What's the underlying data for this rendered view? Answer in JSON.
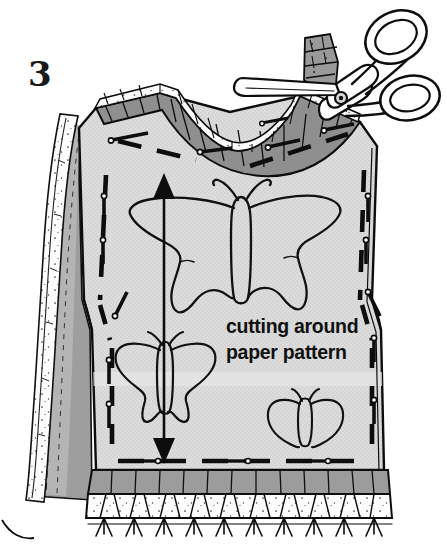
{
  "illustration": {
    "title": "Cutting around paper pattern",
    "domain_kind": "sewing-instruction-line-drawing",
    "step_number": "3",
    "caption_line_1": "cutting around",
    "caption_line_2": "paper pattern",
    "subject": "vest-garment-front-with-pinned-paper-pattern",
    "tools": [
      "scissors"
    ],
    "motifs": [
      "butterfly-large",
      "butterfly-medium",
      "butterfly-small"
    ],
    "markings": [
      "grainline-double-arrow",
      "dashed-cutting-line",
      "straight-pins"
    ]
  },
  "colors": {
    "background": "#ffffff",
    "ink": "#000000",
    "body_fill": "#d9d9d9",
    "body_fill_light": "#e2e2e2",
    "fabric_dark": "#9a9a9a",
    "fabric_mid": "#b3b3b3",
    "binding_gray": "#8f8f8f",
    "paper_white": "#fdfdfd",
    "speckle": "#2b2b2b",
    "caption_text": "#101010",
    "step_text": "#1a1a1a"
  },
  "labels": {
    "step": "3",
    "caption": "cutting around paper pattern",
    "scissors": "scissors",
    "grainline_arrow": "grainline double arrow",
    "pins": "straight pins",
    "cut_edge": "cut fabric edge",
    "fringe": "trimmed fringe edge",
    "butterfly_large": "large swallowtail butterfly",
    "butterfly_medium": "medium butterfly",
    "butterfly_small": "small butterfly"
  },
  "geometry": {
    "width": 447,
    "height": 544,
    "grainline_arrow_x": 164,
    "grainline_arrow_top_y": 175,
    "grainline_arrow_bottom_y": 462
  }
}
